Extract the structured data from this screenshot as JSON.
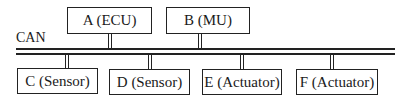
{
  "bus": {
    "label": "CAN"
  },
  "nodes": {
    "a": {
      "label": "A (ECU)"
    },
    "b": {
      "label": "B (MU)"
    },
    "c": {
      "label": "C (Sensor)"
    },
    "d": {
      "label": "D (Sensor)"
    },
    "e": {
      "label": "E (Actuator)"
    },
    "f": {
      "label": "F (Actuator)"
    }
  }
}
